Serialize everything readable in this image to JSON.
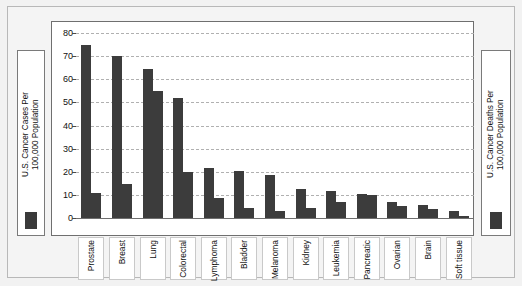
{
  "chart_data": {
    "type": "bar",
    "title": "",
    "xlabel": "",
    "ylabel": "",
    "ylim": [
      0,
      80
    ],
    "yticks": [
      0,
      10,
      20,
      30,
      40,
      50,
      60,
      70,
      80
    ],
    "grid": true,
    "legend_position": "outside-left-and-right",
    "categories": [
      "Prostate",
      "Breast",
      "Lung",
      "Colorectal",
      "Lymphoma",
      "Bladder",
      "Melanoma",
      "Kidney",
      "Leukemia",
      "Pancreatic",
      "Ovarian",
      "Brain",
      "Soft tissue"
    ],
    "series": [
      {
        "name": "U.S. Cancer Cases Per 100,000 Population",
        "color": "#3c3c3c",
        "values": [
          75,
          70,
          64.5,
          52,
          21.5,
          20.5,
          18.5,
          12.5,
          11.5,
          10.5,
          7,
          5.5,
          3
        ]
      },
      {
        "name": "U.S. Cancer Deaths Per 100,000 Population",
        "color": "#3c3c3c",
        "values": [
          11,
          14.5,
          55,
          20,
          8.5,
          4.5,
          3,
          4.5,
          7,
          10,
          5,
          4,
          1
        ]
      }
    ]
  },
  "legend_left": {
    "label": "U.S. Cancer Cases Per\n100,000 Population",
    "swatch_color": "#3a3a3a"
  },
  "legend_right": {
    "label": "U.S. Cancer Deaths Per\n100,000 Population",
    "swatch_color": "#3a3a3a"
  }
}
